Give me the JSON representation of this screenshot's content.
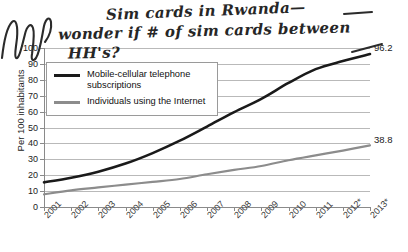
{
  "chart_data": {
    "type": "line",
    "title": "",
    "subtitle": "",
    "xlabel": "",
    "ylabel": "Per 100 inhabitants",
    "ylim": [
      0,
      100
    ],
    "ytick_step": 10,
    "grid": true,
    "legend_position": "top-left",
    "x": [
      "2001",
      "2002",
      "2003",
      "2004",
      "2005",
      "2006",
      "2007",
      "2008",
      "2009",
      "2010",
      "2011",
      "2012*",
      "2013*"
    ],
    "categories": [
      "2001",
      "2002",
      "2003",
      "2004",
      "2005",
      "2006",
      "2007",
      "2008",
      "2009",
      "2010",
      "2011",
      "2012*",
      "2013*"
    ],
    "yticks": [
      "0",
      "10",
      "20",
      "30",
      "40",
      "50",
      "60",
      "70",
      "80",
      "90",
      "100"
    ],
    "series": [
      {
        "name": "Mobile-cellular telephone subscriptions",
        "color": "#1a1a1a",
        "values": [
          15.5,
          18.4,
          22.2,
          27.3,
          33.9,
          41.7,
          50.6,
          59.7,
          68.0,
          78.0,
          86.7,
          91.8,
          96.2
        ],
        "end_label": "96.2"
      },
      {
        "name": "Individuals using the Internet",
        "color": "#8c8c8c",
        "values": [
          8.0,
          10.5,
          12.3,
          14.1,
          15.8,
          17.6,
          20.6,
          23.3,
          25.8,
          29.4,
          32.5,
          35.5,
          38.8
        ],
        "end_label": "38.8"
      }
    ]
  },
  "legend": {
    "items": [
      {
        "label": "Mobile-cellular telephone subscriptions",
        "color": "#1a1a1a"
      },
      {
        "label": "Individuals using the Internet",
        "color": "#8c8c8c"
      }
    ]
  },
  "annotations": {
    "handwriting": [
      "Sim cards in Rwanda—",
      "wonder if # of sim cards between",
      "HH's?"
    ],
    "margin_scribble": "scribble"
  }
}
